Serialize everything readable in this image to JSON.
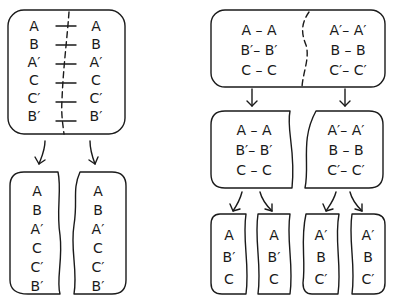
{
  "left_panel": {
    "top_box": {
      "left_column": [
        "A",
        "B",
        "A′",
        "C",
        "C′",
        "B′"
      ],
      "right_column": [
        "A",
        "B",
        "A′",
        "C",
        "C′",
        "B′"
      ],
      "divider": "dashed-wavy-line",
      "crossing_marks": "horizontal-ticks"
    },
    "bottom_boxes": [
      {
        "items": [
          "A",
          "B",
          "A′",
          "C",
          "C′",
          "B′"
        ]
      },
      {
        "items": [
          "A",
          "B",
          "A′",
          "C",
          "C′",
          "B′"
        ]
      }
    ]
  },
  "right_panel": {
    "top_box": {
      "left_pairs": [
        "A – A",
        "B′– B′",
        "C – C"
      ],
      "right_pairs": [
        "A′– A′",
        "B – B",
        "C′– C′"
      ],
      "divider": "dashed-wavy-line"
    },
    "middle_boxes": [
      {
        "pairs": [
          "A – A",
          "B′– B′",
          "C – C"
        ]
      },
      {
        "pairs": [
          "A′– A′",
          "B – B",
          "C′– C′"
        ]
      }
    ],
    "bottom_boxes": [
      {
        "items": [
          "A",
          "B′",
          "C"
        ]
      },
      {
        "items": [
          "A",
          "B′",
          "C"
        ]
      },
      {
        "items": [
          "A′",
          "B",
          "C′"
        ]
      },
      {
        "items": [
          "A′",
          "B",
          "C′"
        ]
      }
    ]
  },
  "colors": {
    "stroke": "#1a1a1a",
    "background": "#ffffff"
  }
}
